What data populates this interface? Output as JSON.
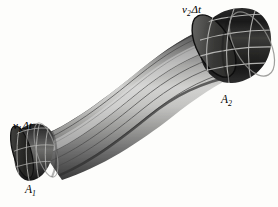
{
  "figure": {
    "background_color": "#fdfdfb",
    "ink_color": "#000000"
  },
  "labels": {
    "inlet_length": {
      "symbol": "v",
      "subscript": "1",
      "operator": "Δt"
    },
    "outlet_length": {
      "symbol": "v",
      "subscript": "2",
      "operator": "Δt"
    },
    "inlet_area": {
      "symbol": "A",
      "subscript": "1"
    },
    "outlet_area": {
      "symbol": "A",
      "subscript": "2"
    }
  },
  "tube": {
    "shading": {
      "edge_dark": "#3a3a3a",
      "mid_dark": "#6f6f6f",
      "highlight": "#d4d4d2",
      "body_mid": "#9a9a9a"
    },
    "streamline_color": "#4c4c4c",
    "streamline_count": 6,
    "collar_dark": "#1d1d1d",
    "collar_mid": "#3f3f3f",
    "collar_light": "#8a8a8a",
    "grid_line_color": "#b9b9b7"
  }
}
